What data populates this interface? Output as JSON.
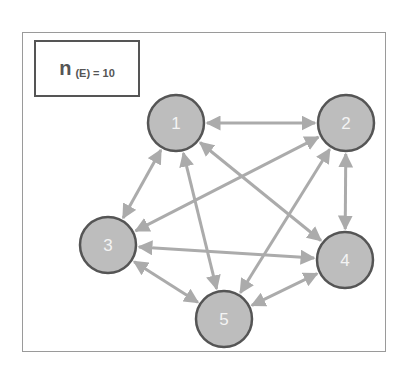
{
  "label": {
    "n": "n",
    "sub": "(E) = 10"
  },
  "colors": {
    "edge": "#ababab",
    "node_fill": "#bdbdbd",
    "node_stroke": "#555555",
    "label_text": "#f4f4f4"
  },
  "nodes": [
    {
      "id": "1",
      "label": "1",
      "x": 176,
      "y": 123
    },
    {
      "id": "2",
      "label": "2",
      "x": 346,
      "y": 123
    },
    {
      "id": "3",
      "label": "3",
      "x": 108,
      "y": 245
    },
    {
      "id": "4",
      "label": "4",
      "x": 345,
      "y": 260
    },
    {
      "id": "5",
      "label": "5",
      "x": 224,
      "y": 319
    }
  ],
  "edges": [
    [
      "1",
      "2"
    ],
    [
      "1",
      "3"
    ],
    [
      "1",
      "4"
    ],
    [
      "1",
      "5"
    ],
    [
      "2",
      "3"
    ],
    [
      "2",
      "4"
    ],
    [
      "2",
      "5"
    ],
    [
      "3",
      "4"
    ],
    [
      "3",
      "5"
    ],
    [
      "4",
      "5"
    ]
  ],
  "node_radius": 28
}
